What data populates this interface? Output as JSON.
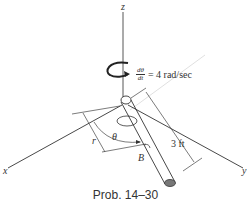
{
  "diagram": {
    "axes": {
      "z": "z",
      "x": "x",
      "y": "y"
    },
    "rate": {
      "numerator": "dθ",
      "denominator": "dt",
      "value": "= 4 rad/sec"
    },
    "labels": {
      "r": "r",
      "theta": "θ",
      "B": "B"
    },
    "length": "3 ft",
    "caption": "Prob. 14–30"
  }
}
